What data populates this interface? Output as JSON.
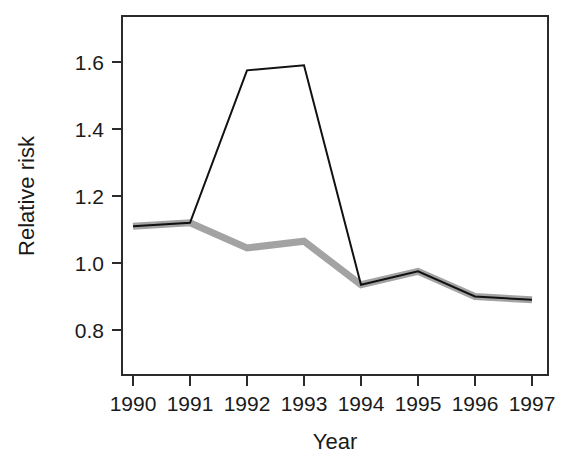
{
  "chart_data": {
    "type": "line",
    "title": "",
    "subtitle": "",
    "xlabel": "Year",
    "ylabel": "Relative risk",
    "categories": [
      "1990",
      "1991",
      "1992",
      "1993",
      "1994",
      "1995",
      "1996",
      "1997"
    ],
    "x": [
      1990,
      1991,
      1992,
      1993,
      1994,
      1995,
      1996,
      1997
    ],
    "series": [
      {
        "name": "black-line",
        "color": "#111111",
        "linewidth": 2,
        "values": [
          1.11,
          1.12,
          1.575,
          1.59,
          0.935,
          0.975,
          0.9,
          0.89
        ]
      },
      {
        "name": "gray-line",
        "color": "#a3a3a3",
        "linewidth": 7,
        "values": [
          1.11,
          1.12,
          1.045,
          1.065,
          0.935,
          0.975,
          0.9,
          0.89
        ]
      }
    ],
    "xlim": [
      1989.8,
      1997.3
    ],
    "ylim": [
      0.72,
      1.68
    ],
    "yticks": [
      0.8,
      1.0,
      1.2,
      1.4,
      1.6
    ],
    "ytick_labels": [
      "0.8",
      "1.0",
      "1.2",
      "1.4",
      "1.6"
    ],
    "xticks": [
      1990,
      1991,
      1992,
      1993,
      1994,
      1995,
      1996,
      1997
    ],
    "xtick_labels": [
      "1990",
      "1991",
      "1992",
      "1993",
      "1994",
      "1995",
      "1996",
      "1997"
    ],
    "grid": false,
    "legend": null,
    "legend_position": "none",
    "frame": true,
    "annotations": []
  },
  "axis": {
    "x_title": "Year",
    "y_title": "Relative risk"
  },
  "ytick_labels": {
    "t0": "0.8",
    "t1": "1.0",
    "t2": "1.2",
    "t3": "1.4",
    "t4": "1.6"
  },
  "xtick_labels": {
    "t0": "1990",
    "t1": "1991",
    "t2": "1992",
    "t3": "1993",
    "t4": "1994",
    "t5": "1995",
    "t6": "1996",
    "t7": "1997"
  },
  "colors": {
    "black_series": "#111111",
    "gray_series": "#a3a3a3",
    "frame": "#2b2b2b",
    "text": "#1a1a1a",
    "background": "#ffffff"
  }
}
